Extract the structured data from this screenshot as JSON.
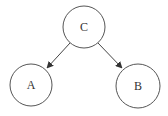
{
  "diagram": {
    "type": "directed-graph",
    "nodes": [
      {
        "id": "C",
        "label": "C",
        "cx": 84,
        "cy": 27,
        "r": 21
      },
      {
        "id": "A",
        "label": "A",
        "cx": 31,
        "cy": 85,
        "r": 21
      },
      {
        "id": "B",
        "label": "B",
        "cx": 138,
        "cy": 86,
        "r": 22
      }
    ],
    "edges": [
      {
        "from": "C",
        "to": "A"
      },
      {
        "from": "C",
        "to": "B"
      }
    ],
    "colors": {
      "stroke": "#555555",
      "edge": "#444444",
      "text": "#333333",
      "background": "#ffffff"
    }
  }
}
